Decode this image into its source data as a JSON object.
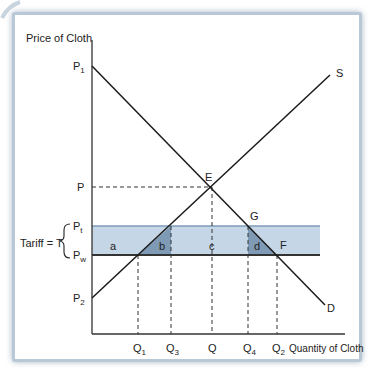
{
  "diagram": {
    "y_axis_label": "Price of Cloth",
    "x_axis_label": "Quantity of Cloth",
    "price_labels": {
      "P1": {
        "main": "P",
        "sub": "1"
      },
      "P": {
        "main": "P",
        "sub": ""
      },
      "Pt": {
        "main": "P",
        "sub": "t"
      },
      "Pw": {
        "main": "P",
        "sub": "w"
      },
      "P2": {
        "main": "P",
        "sub": "2"
      }
    },
    "quantity_labels": {
      "Q1": {
        "main": "Q",
        "sub": "1"
      },
      "Q3": {
        "main": "Q",
        "sub": "3"
      },
      "Q": {
        "main": "Q",
        "sub": ""
      },
      "Q4": {
        "main": "Q",
        "sub": "4"
      },
      "Q2": {
        "main": "Q",
        "sub": "2"
      }
    },
    "tariff_label": "Tariff = T",
    "curves": {
      "supply": "S",
      "demand": "D"
    },
    "points": {
      "equilibrium": "E",
      "G": "G",
      "F": "F"
    },
    "areas": {
      "a": "a",
      "b": "b",
      "c": "c",
      "d": "d"
    },
    "colors": {
      "band_light": "#c5d6e6",
      "band_dark": "#7f9ab4",
      "tariff_line": "#7d9cba",
      "world_line": "#333333",
      "curve": "#1a1a1a",
      "frame": "#b9c8d6"
    }
  }
}
